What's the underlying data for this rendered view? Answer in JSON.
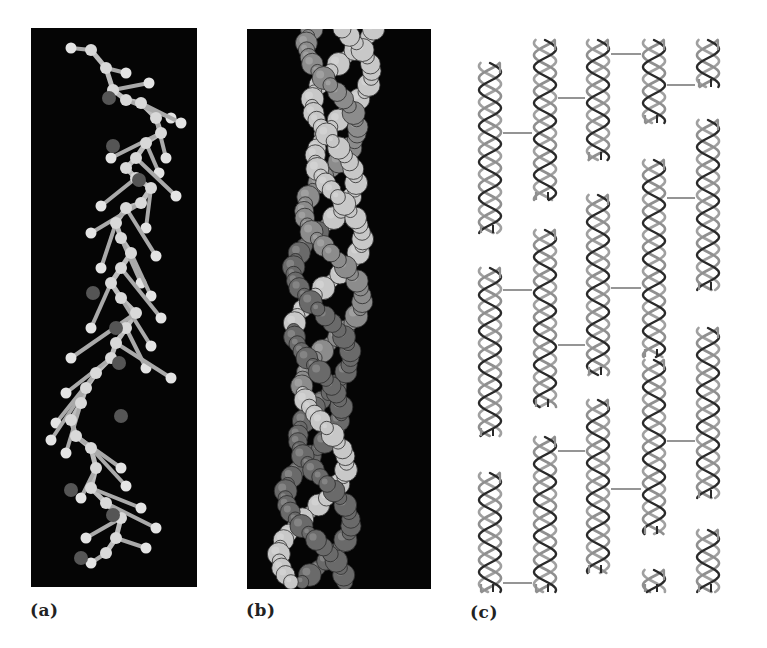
{
  "figure": {
    "panels": [
      {
        "id": "a",
        "label": "(a)",
        "description": "Ball-and-stick model of a single polypeptide chain in a left-handed helical conformation",
        "background": "#050505",
        "atom_colors": {
          "light": "#d9d9d9",
          "dark": "#555555"
        }
      },
      {
        "id": "b",
        "label": "(b)",
        "description": "Space-filling model of three intertwined chains forming a triple helix",
        "background": "#050505",
        "strand_colors": [
          "#c8c8c8",
          "#6a6a6a",
          "#8c8c8c"
        ]
      },
      {
        "id": "c",
        "label": "(c)",
        "description": "Staggered array of triple-helical molecules linked by crosslinks, forming a fibril",
        "strand_colors": {
          "dark": "#2a2a2a",
          "gray": "#8f8f8f"
        },
        "crosslink_color": "#7a7a7a"
      }
    ],
    "fibril": {
      "columns": [
        {
          "x": 490,
          "segments": [
            [
              63,
              233
            ],
            [
              268,
              436
            ],
            [
              473,
              592
            ]
          ]
        },
        {
          "x": 545,
          "segments": [
            [
              40,
              200
            ],
            [
              230,
              407
            ],
            [
              437,
              592
            ]
          ]
        },
        {
          "x": 598,
          "segments": [
            [
              40,
              160
            ],
            [
              195,
              375
            ],
            [
              400,
              573
            ]
          ]
        },
        {
          "x": 654,
          "segments": [
            [
              40,
              123
            ],
            [
              160,
              357
            ],
            [
              360,
              534
            ],
            [
              570,
              592
            ]
          ]
        },
        {
          "x": 708,
          "segments": [
            [
              40,
              87
            ],
            [
              120,
              290
            ],
            [
              328,
              498
            ],
            [
              530,
              592
            ]
          ]
        }
      ],
      "crosslinks": [
        {
          "from": 0,
          "to": 1,
          "y": 133
        },
        {
          "from": 1,
          "to": 2,
          "y": 98
        },
        {
          "from": 2,
          "to": 3,
          "y": 54
        },
        {
          "from": 3,
          "to": 4,
          "y": 85
        },
        {
          "from": 0,
          "to": 1,
          "y": 290
        },
        {
          "from": 1,
          "to": 2,
          "y": 345
        },
        {
          "from": 2,
          "to": 3,
          "y": 288
        },
        {
          "from": 3,
          "to": 4,
          "y": 198
        },
        {
          "from": 1,
          "to": 2,
          "y": 451
        },
        {
          "from": 2,
          "to": 3,
          "y": 489
        },
        {
          "from": 3,
          "to": 4,
          "y": 441
        },
        {
          "from": 0,
          "to": 1,
          "y": 583
        }
      ]
    }
  }
}
